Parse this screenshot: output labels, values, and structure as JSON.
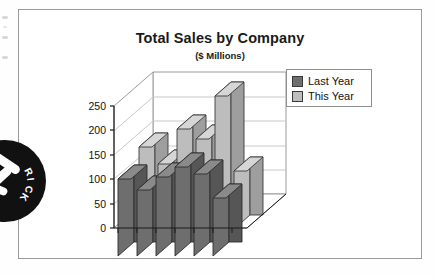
{
  "page": {
    "background_color": "#ffffff",
    "frame_border_color": "#9a9a9a"
  },
  "stamp": {
    "name": "circular-ink-stamp",
    "visible_text": "RICK",
    "color": "#111111"
  },
  "chart_data": {
    "type": "bar",
    "variant": "3d-clustered-bar",
    "title": "Total Sales by Company",
    "subtitle": "($ Millions)",
    "xlabel": "",
    "ylabel": "",
    "ylim": [
      0,
      250
    ],
    "yticks": [
      0,
      50,
      100,
      150,
      200,
      250
    ],
    "ytick_labels": [
      "0",
      "50",
      "100",
      "150",
      "200",
      "250"
    ],
    "grid": true,
    "grid_orientation": "horizontal",
    "legend_position": "top-right",
    "categories": [
      "",
      "",
      "",
      "",
      "",
      "",
      ""
    ],
    "category_tick_count": 7,
    "series": [
      {
        "name": "Last Year",
        "color": "#6e6e6e",
        "side_color": "#565656",
        "top_color": "#8a8a8a",
        "row": "front",
        "values": [
          100,
          78,
          105,
          125,
          110,
          63,
          0
        ]
      },
      {
        "name": "This Year",
        "color": "#bdbdbd",
        "side_color": "#9e9e9e",
        "top_color": "#d6d6d6",
        "row": "back",
        "values": [
          0,
          168,
          133,
          205,
          185,
          272,
          120
        ]
      }
    ]
  },
  "legend": {
    "items": [
      {
        "label": "Last Year",
        "swatch": "#6e6e6e"
      },
      {
        "label": "This Year",
        "swatch": "#bdbdbd"
      }
    ]
  },
  "axis": {
    "tick_labels": [
      "250",
      "200",
      "150",
      "100",
      "50",
      "0"
    ]
  }
}
